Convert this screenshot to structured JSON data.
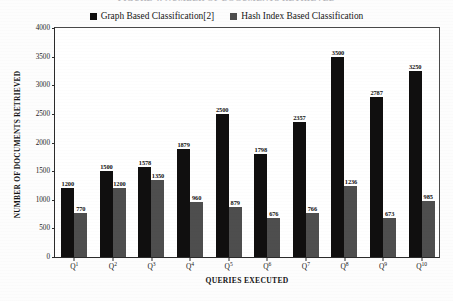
{
  "title": "FIGURE 4: NUMBER OF DOCUMENTS RETRIEVED",
  "legend": {
    "items": [
      {
        "label": "Graph Based Classification[2]",
        "color": "#100f0f",
        "swatch": "filled-square-icon"
      },
      {
        "label": "Hash Index Based Classification",
        "color": "#4e4e4e",
        "swatch": "filled-square-icon"
      }
    ]
  },
  "axes": {
    "ylabel": "NUMBER OF DOCUMENTS RETRIEVED",
    "xlabel": "QUERIES EXECUTED",
    "yticks": [
      4000,
      3500,
      3000,
      2500,
      2000,
      1500,
      1000,
      500,
      0
    ]
  },
  "chart_data": {
    "type": "bar",
    "title": "FIGURE 4: NUMBER OF DOCUMENTS RETRIEVED",
    "xlabel": "QUERIES EXECUTED",
    "ylabel": "NUMBER OF DOCUMENTS RETRIEVED",
    "ylim": [
      0,
      4000
    ],
    "ytick_step": 500,
    "grid": false,
    "legend_position": "top-center",
    "categories": [
      "Q1",
      "Q2",
      "Q3",
      "Q4",
      "Q5",
      "Q6",
      "Q7",
      "Q8",
      "Q9",
      "Q10"
    ],
    "series": [
      {
        "name": "Graph Based Classification[2]",
        "color": "#100f0f",
        "values": [
          1200,
          1500,
          1578,
          1879,
          2500,
          1798,
          2357,
          3500,
          2787,
          3250
        ]
      },
      {
        "name": "Hash Index Based Classification",
        "color": "#4e4e4e",
        "values": [
          770,
          1200,
          1350,
          960,
          879,
          676,
          766,
          1236,
          673,
          985
        ]
      }
    ]
  }
}
